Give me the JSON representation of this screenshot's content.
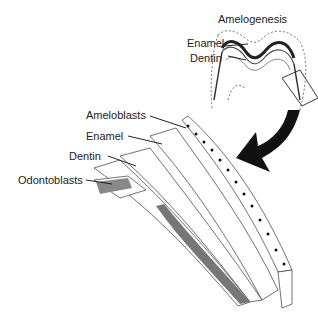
{
  "title": "Amelogenesis",
  "tooth_labels": {
    "enamel": "Enamel",
    "dentin": "Dentin"
  },
  "detail_labels": {
    "ameloblasts": "Ameloblasts",
    "enamel": "Enamel",
    "dentin": "Dentin",
    "odontoblasts": "Odontoblasts"
  }
}
